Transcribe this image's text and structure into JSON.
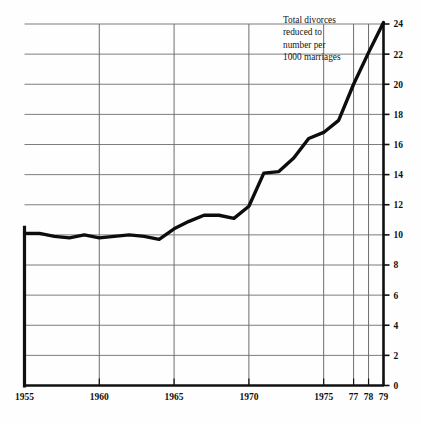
{
  "chart_data": {
    "type": "line",
    "title": "",
    "subtitle": "",
    "annotation": {
      "lines": [
        "Total divorces",
        "reduced to",
        "number per",
        "1000 marriages"
      ],
      "text": "Total divorces reduced to number per 1000 marriages"
    },
    "xlabel": "",
    "ylabel": "",
    "xlim": [
      1955,
      1979
    ],
    "ylim": [
      0,
      24
    ],
    "ytick_step": 2,
    "grid": true,
    "legend": false,
    "line_color": "#0d0d0d",
    "grid_color": "#6e6e6e",
    "axis_color": "#101010",
    "background_color": "#fefefe",
    "xticks": [
      {
        "value": 1955,
        "label": "1955",
        "gridline": false
      },
      {
        "value": 1960,
        "label": "1960",
        "gridline": true
      },
      {
        "value": 1965,
        "label": "1965",
        "gridline": true
      },
      {
        "value": 1970,
        "label": "1970",
        "gridline": true
      },
      {
        "value": 1975,
        "label": "1975",
        "gridline": true
      },
      {
        "value": 1977,
        "label": "77",
        "gridline": true
      },
      {
        "value": 1978,
        "label": "78",
        "gridline": true
      },
      {
        "value": 1979,
        "label": "79",
        "gridline": true
      }
    ],
    "yticks": [
      {
        "value": 0,
        "label": "0"
      },
      {
        "value": 2,
        "label": "2"
      },
      {
        "value": 4,
        "label": "4"
      },
      {
        "value": 6,
        "label": "6"
      },
      {
        "value": 8,
        "label": "8"
      },
      {
        "value": 10,
        "label": "10"
      },
      {
        "value": 12,
        "label": "12"
      },
      {
        "value": 14,
        "label": "14"
      },
      {
        "value": 16,
        "label": "16"
      },
      {
        "value": 18,
        "label": "18"
      },
      {
        "value": 20,
        "label": "20"
      },
      {
        "value": 22,
        "label": "22"
      },
      {
        "value": 24,
        "label": "24"
      }
    ],
    "x": [
      1955,
      1956,
      1957,
      1958,
      1959,
      1960,
      1961,
      1962,
      1963,
      1964,
      1965,
      1966,
      1967,
      1968,
      1969,
      1970,
      1971,
      1972,
      1973,
      1974,
      1975,
      1976,
      1977,
      1978,
      1979
    ],
    "series": [
      {
        "name": "Total divorces per 1000 marriages",
        "values": [
          10.1,
          10.1,
          9.9,
          9.8,
          10.0,
          9.8,
          9.9,
          10.0,
          9.9,
          9.7,
          10.4,
          10.9,
          11.3,
          11.3,
          11.1,
          11.9,
          14.1,
          14.2,
          15.1,
          16.4,
          16.8,
          17.6,
          20.0,
          22.1,
          24.1
        ]
      }
    ]
  },
  "top_bleed": {
    "text": ""
  }
}
